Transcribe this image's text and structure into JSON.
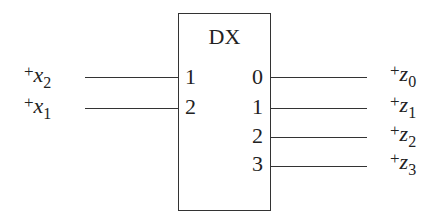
{
  "block": {
    "label": "DX"
  },
  "inputs": [
    {
      "sign": "+",
      "var": "x",
      "sub": "2",
      "pin": "1"
    },
    {
      "sign": "+",
      "var": "x",
      "sub": "1",
      "pin": "2"
    }
  ],
  "outputs": [
    {
      "sign": "+",
      "var": "z",
      "sub": "0",
      "pin": "0"
    },
    {
      "sign": "+",
      "var": "z",
      "sub": "1",
      "pin": "1"
    },
    {
      "sign": "+",
      "var": "z",
      "sub": "2",
      "pin": "2"
    },
    {
      "sign": "+",
      "var": "z",
      "sub": "3",
      "pin": "3"
    }
  ]
}
